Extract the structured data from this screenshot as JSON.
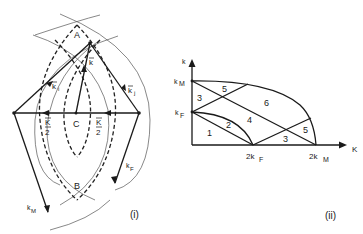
{
  "figure_i": {
    "caption": "(i)",
    "points": {
      "A": "A",
      "B": "B",
      "C": "C"
    },
    "vectors": {
      "k": "k",
      "k_i": "k",
      "k_i_sub": "i",
      "k_j": "k",
      "k_j_sub": "j",
      "K_half_left_num": "K",
      "K_half_left_den": "2",
      "K_half_right_num": "K",
      "K_half_right_den": "2",
      "k_F": "k",
      "k_F_sub": "F",
      "k_M": "k",
      "k_M_sub": "M"
    }
  },
  "figure_ii": {
    "caption": "(ii)",
    "y_axis_label": "k",
    "x_axis_label": "K",
    "y_ticks": [
      {
        "main": "k",
        "sub": "M"
      },
      {
        "main": "k",
        "sub": "F"
      }
    ],
    "x_ticks": [
      {
        "main": "2k",
        "sub": "F"
      },
      {
        "main": "2k",
        "sub": "M"
      }
    ],
    "regions": [
      "1",
      "2",
      "3",
      "4",
      "5",
      "6",
      "3",
      "5"
    ]
  }
}
